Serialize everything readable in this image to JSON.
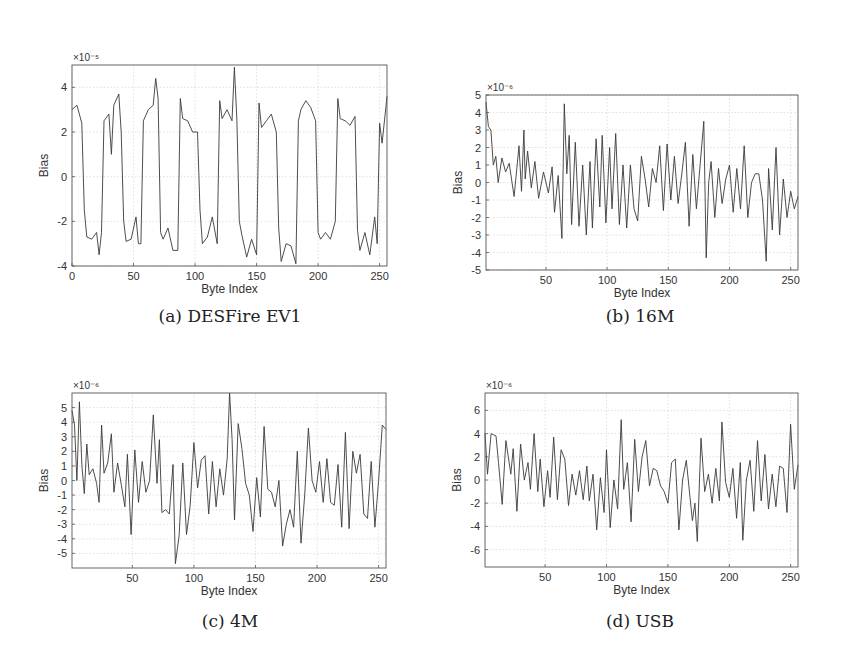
{
  "chart_data": [
    {
      "id": "a",
      "type": "line",
      "caption": "(a) DESFire EV1",
      "xlabel": "Byte Index",
      "ylabel": "Bias",
      "exponent": "×10⁻⁵",
      "xlim": [
        0,
        256
      ],
      "ylim": [
        -4,
        5
      ],
      "xticks": [
        0,
        50,
        100,
        150,
        200,
        250
      ],
      "yticks": [
        -4,
        -2,
        0,
        2,
        4
      ],
      "grid": true,
      "box": {
        "left": 72,
        "top": 65,
        "right": 387,
        "bottom": 266
      },
      "x": [
        0,
        4,
        8,
        10,
        12,
        16,
        20,
        22,
        24,
        26,
        30,
        32,
        34,
        38,
        40,
        42,
        44,
        48,
        52,
        54,
        56,
        58,
        62,
        66,
        68,
        70,
        72,
        74,
        78,
        82,
        86,
        88,
        90,
        94,
        98,
        102,
        104,
        106,
        110,
        114,
        118,
        120,
        122,
        126,
        130,
        132,
        134,
        136,
        138,
        142,
        146,
        150,
        152,
        154,
        158,
        162,
        166,
        168,
        170,
        174,
        178,
        182,
        184,
        186,
        190,
        194,
        198,
        200,
        202,
        206,
        210,
        214,
        216,
        218,
        222,
        226,
        230,
        232,
        234,
        238,
        242,
        246,
        248,
        250,
        252,
        256
      ],
      "values": [
        3.0,
        3.2,
        2.4,
        -1.5,
        -2.7,
        -2.8,
        -2.5,
        -3.5,
        -2.5,
        2.5,
        2.8,
        1.0,
        3.2,
        3.7,
        2.0,
        -2.0,
        -2.9,
        -2.8,
        -1.8,
        -3.0,
        -3.0,
        2.5,
        3.0,
        3.2,
        4.4,
        3.5,
        -2.5,
        -2.8,
        -2.3,
        -3.3,
        -3.3,
        3.5,
        2.6,
        2.5,
        2.0,
        2.0,
        -1.5,
        -3.0,
        -2.7,
        -1.8,
        -3.0,
        3.4,
        2.6,
        3.0,
        2.5,
        4.9,
        2.5,
        -2.0,
        -2.6,
        -3.6,
        -2.8,
        -3.5,
        3.3,
        2.2,
        2.5,
        2.8,
        2.0,
        -2.3,
        -3.8,
        -3.0,
        -3.1,
        -3.9,
        2.5,
        3.0,
        3.4,
        3.1,
        2.5,
        -2.5,
        -2.8,
        -2.5,
        -2.8,
        -2.0,
        3.5,
        2.6,
        2.5,
        2.3,
        2.7,
        -2.4,
        -3.3,
        -2.5,
        -3.5,
        -1.8,
        -3.0,
        2.4,
        1.5,
        3.6
      ]
    },
    {
      "id": "b",
      "type": "line",
      "caption": "(b) 16M",
      "xlabel": "Byte Index",
      "ylabel": "Bias",
      "exponent": "×10⁻⁶",
      "xlim": [
        1,
        256
      ],
      "ylim": [
        -5,
        5
      ],
      "xticks": [
        50,
        100,
        150,
        200,
        250
      ],
      "yticks": [
        -5,
        -4,
        -3,
        -2,
        -1,
        0,
        1,
        2,
        3,
        4,
        5
      ],
      "grid": true,
      "box": {
        "left": 486,
        "top": 95,
        "right": 798,
        "bottom": 270
      },
      "x": [
        1,
        3,
        5,
        7,
        9,
        11,
        14,
        17,
        20,
        24,
        28,
        30,
        32,
        33,
        35,
        38,
        41,
        44,
        48,
        52,
        55,
        57,
        60,
        63,
        65,
        67,
        69,
        71,
        74,
        77,
        80,
        83,
        86,
        88,
        91,
        94,
        96,
        99,
        102,
        104,
        107,
        110,
        113,
        116,
        119,
        122,
        125,
        128,
        131,
        134,
        137,
        140,
        143,
        146,
        149,
        152,
        155,
        158,
        161,
        164,
        167,
        170,
        173,
        176,
        179,
        181,
        183,
        185,
        188,
        191,
        194,
        197,
        200,
        203,
        206,
        209,
        212,
        215,
        218,
        221,
        224,
        227,
        230,
        232,
        235,
        238,
        241,
        244,
        247,
        250,
        253,
        256
      ],
      "values": [
        4.6,
        3.2,
        3.0,
        1.0,
        1.5,
        0.0,
        1.4,
        0.6,
        1.1,
        -0.8,
        2.1,
        -0.5,
        3.0,
        0.2,
        1.8,
        -0.3,
        1.2,
        -0.9,
        0.6,
        -0.6,
        0.9,
        -1.7,
        0.4,
        -3.2,
        4.5,
        0.5,
        2.7,
        -2.4,
        2.3,
        -2.5,
        1.0,
        -3.0,
        1.2,
        -2.6,
        2.5,
        -1.4,
        2.7,
        -2.3,
        2.0,
        -1.5,
        2.8,
        -2.4,
        1.0,
        -2.6,
        1.0,
        -1.5,
        -2.2,
        1.5,
        0.2,
        -1.4,
        0.8,
        0.0,
        2.1,
        -1.6,
        2.2,
        -1.0,
        1.5,
        -1.2,
        0.5,
        2.3,
        -2.5,
        1.6,
        -1.5,
        1.0,
        3.5,
        -4.3,
        0.0,
        1.2,
        -2.0,
        0.8,
        -1.2,
        0.2,
        1.0,
        -1.7,
        0.8,
        -1.5,
        2.1,
        -2.0,
        0.0,
        0.5,
        0.5,
        -1.0,
        -4.5,
        0.8,
        -2.7,
        2.0,
        -3.0,
        0.2,
        -2.0,
        -0.5,
        -1.5,
        -0.8
      ]
    },
    {
      "id": "c",
      "type": "line",
      "caption": "(c) 4M",
      "xlabel": "Byte Index",
      "ylabel": "Bias",
      "exponent": "×10⁻⁶",
      "xlim": [
        1,
        256
      ],
      "ylim": [
        -6,
        6
      ],
      "xticks": [
        50,
        100,
        150,
        200,
        250
      ],
      "yticks": [
        -5,
        -4,
        -3,
        -2,
        -1,
        0,
        1,
        2,
        3,
        4,
        5
      ],
      "grid": true,
      "box": {
        "left": 72,
        "top": 393,
        "right": 386,
        "bottom": 568
      },
      "x": [
        1,
        3,
        5,
        7,
        9,
        11,
        13,
        15,
        18,
        21,
        23,
        25,
        27,
        30,
        33,
        35,
        38,
        41,
        44,
        46,
        49,
        52,
        55,
        58,
        61,
        64,
        67,
        70,
        72,
        74,
        77,
        80,
        83,
        85,
        88,
        91,
        94,
        97,
        100,
        103,
        106,
        109,
        112,
        115,
        118,
        121,
        124,
        127,
        129,
        131,
        133,
        136,
        139,
        142,
        145,
        148,
        151,
        154,
        157,
        160,
        163,
        166,
        169,
        172,
        175,
        178,
        181,
        184,
        187,
        190,
        193,
        196,
        199,
        202,
        205,
        208,
        211,
        214,
        217,
        220,
        223,
        226,
        229,
        232,
        235,
        238,
        241,
        244,
        247,
        250,
        253,
        256
      ],
      "values": [
        4.8,
        3.8,
        0.0,
        5.4,
        1.0,
        -0.9,
        2.5,
        0.4,
        0.8,
        -0.2,
        -1.5,
        3.8,
        0.5,
        1.2,
        3.2,
        -0.8,
        1.2,
        -0.3,
        -1.8,
        1.8,
        -3.7,
        2.1,
        -1.5,
        1.3,
        -0.8,
        0.0,
        4.5,
        -0.2,
        2.8,
        -2.2,
        -2.0,
        -2.3,
        1.1,
        -5.7,
        -3.8,
        1.2,
        -3.7,
        -1.7,
        2.6,
        -0.5,
        1.4,
        1.7,
        -2.3,
        1.3,
        -1.8,
        0.8,
        -1.0,
        1.5,
        6.0,
        2.8,
        -2.7,
        3.9,
        2.2,
        -0.2,
        -1.0,
        -3.5,
        0.2,
        -2.5,
        3.7,
        -0.6,
        -0.8,
        -1.8,
        0.0,
        -4.5,
        -3.0,
        -2.0,
        -3.2,
        2.0,
        -4.3,
        -1.0,
        3.6,
        0.0,
        -0.8,
        1.3,
        -1.5,
        1.5,
        -1.5,
        -1.7,
        1.1,
        -3.2,
        3.3,
        -3.3,
        2.0,
        0.5,
        1.8,
        -2.3,
        -2.6,
        1.3,
        -3.2,
        0.0,
        3.8,
        3.5
      ]
    },
    {
      "id": "d",
      "type": "line",
      "caption": "(d) USB",
      "xlabel": "Byte Index",
      "ylabel": "Bias",
      "exponent": "×10⁻⁶",
      "xlim": [
        1,
        256
      ],
      "ylim": [
        -7.5,
        7.5
      ],
      "xticks": [
        50,
        100,
        150,
        200,
        250
      ],
      "yticks": [
        -6,
        -4,
        -2,
        0,
        2,
        4,
        6
      ],
      "grid": true,
      "box": {
        "left": 485,
        "top": 393,
        "right": 798,
        "bottom": 567
      },
      "x": [
        1,
        3,
        6,
        8,
        10,
        12,
        15,
        18,
        20,
        22,
        24,
        27,
        30,
        33,
        36,
        38,
        41,
        44,
        46,
        49,
        52,
        54,
        57,
        60,
        63,
        66,
        69,
        72,
        75,
        78,
        81,
        84,
        86,
        89,
        92,
        95,
        98,
        100,
        103,
        106,
        109,
        112,
        114,
        117,
        120,
        123,
        126,
        129,
        132,
        135,
        138,
        141,
        144,
        147,
        150,
        153,
        156,
        159,
        162,
        165,
        168,
        170,
        172,
        174,
        177,
        180,
        183,
        186,
        189,
        192,
        194,
        197,
        200,
        203,
        206,
        209,
        211,
        214,
        217,
        220,
        223,
        226,
        229,
        232,
        235,
        238,
        241,
        244,
        247,
        250,
        253,
        256
      ],
      "values": [
        4.0,
        0.5,
        4.0,
        3.9,
        3.8,
        1.5,
        -2.1,
        3.4,
        2.0,
        0.5,
        2.7,
        -2.7,
        3.1,
        0.0,
        1.5,
        -0.8,
        4.0,
        -1.0,
        1.8,
        -2.3,
        0.8,
        -1.5,
        3.7,
        -1.7,
        2.6,
        1.8,
        -2.2,
        0.5,
        -1.3,
        0.8,
        -1.7,
        1.2,
        -1.8,
        0.5,
        -4.3,
        0.2,
        -2.8,
        2.6,
        -4.1,
        0.0,
        -2.5,
        5.2,
        -0.8,
        1.5,
        -3.6,
        3.5,
        -1.0,
        2.0,
        3.4,
        -0.5,
        1.0,
        0.8,
        -0.5,
        -1.0,
        -2.0,
        1.5,
        1.8,
        -4.3,
        0.0,
        1.7,
        -1.5,
        -3.5,
        -2.0,
        -5.3,
        3.6,
        -1.0,
        0.5,
        -2.0,
        1.0,
        -1.8,
        5.0,
        -0.2,
        -1.5,
        1.0,
        -3.3,
        1.5,
        -5.2,
        0.0,
        1.7,
        -2.7,
        3.4,
        -1.8,
        2.2,
        -2.5,
        0.5,
        -2.3,
        1.2,
        1.0,
        -2.8,
        4.8,
        -0.8,
        1.3
      ]
    }
  ],
  "colors": {
    "line": "#3a3a3a",
    "axis": "#555555",
    "grid": "#d8d8d8",
    "text": "#333333"
  }
}
